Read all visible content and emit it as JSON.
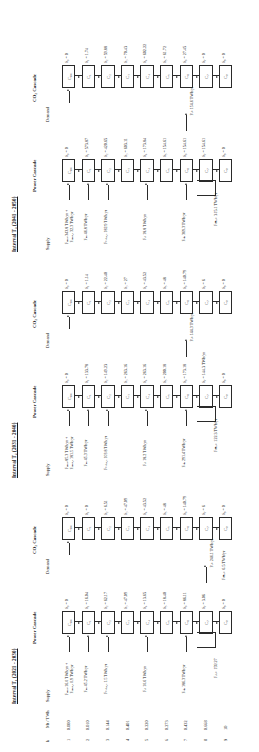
{
  "figure": {
    "title_hidden": "Power and CO2 cascade tables for three planning intervals",
    "row_header_k": "k",
    "row_header_mt": "Mt / TWh",
    "col_supply": "Supply",
    "col_demand": "Demand",
    "col_power_cascade": "Power Cascade",
    "col_co2_cascade": "CO₂ Cascade"
  },
  "axis": {
    "k_values": [
      "1",
      "2",
      "3",
      "4",
      "5",
      "6",
      "7",
      "8",
      "9"
    ],
    "mt_values": [
      "0.000",
      "0.010",
      "0.144",
      "0.401",
      "0.220",
      "0.273",
      "0.432",
      "0.668",
      "10"
    ]
  },
  "intervals": [
    {
      "id": "T1",
      "title": "Interval T₁ (2021 - 2030)",
      "power": {
        "cells": [
          "C₀₀₀",
          "C₁",
          "C₂",
          "C₃",
          "C₄",
          "C₅",
          "C₆",
          "C₇",
          "C₈"
        ],
        "deltas": [
          "δ₀ = 0",
          "δ₁ = 16.04",
          "δ₂ = 62.17",
          "δ₃ = 47.09",
          "δ₄ = 13.65",
          "δ₅ = 18.40",
          "δ₆ = 86.11",
          "δ₇ = 3.06",
          "δ₈ = 0"
        ],
        "supply_flows": [
          {
            "row": 1,
            "text": "Fₐₙₑᵥ 16.0 TWh/yr +\nFₐₙₑᵥ,ₑ 0.9 TWh/yr"
          },
          {
            "row": 2,
            "text": "Fₙₑ 45.2 TWh/yr"
          },
          {
            "row": 3,
            "text": "Fₛₒₗₐᵣ,ₑ 1.5 TWh/yr"
          },
          {
            "row": 5,
            "text": "Fₑₗ 10.6 TWh/yr"
          },
          {
            "row": 7,
            "text": "Fₒₕ 186.3 TWh/yr"
          }
        ],
        "demand_flows": [
          {
            "row": 8,
            "text": "Pₑₖ 246.1 TWh/yr"
          }
        ],
        "residual": "Fₑₗₑₛ 159.27"
      },
      "co2": {
        "cells": [
          "C₀₀₀",
          "C₁",
          "C₂",
          "C₃",
          "C₄",
          "C₅",
          "C₆",
          "C₇",
          "C₈"
        ],
        "deltas": [
          "δ₀ = 0",
          "δ₁ = 0",
          "δ₂ = 6.51",
          "δ₃ = 47.09",
          "δ₄ = 43.52",
          "δ₅ = 48",
          "δ₆ = 140.79",
          "δ₇ = 6",
          "δ₈ = 0"
        ],
        "residual": "Fₗₘₑₛ 6.5 TWh/yr"
      }
    },
    {
      "id": "T2",
      "title": "Interval T₂ (2031 - 2040)",
      "power": {
        "cells": [
          "C₀₀₀",
          "C₁",
          "C₂",
          "C₃",
          "C₄",
          "C₅",
          "C₆",
          "C₇",
          "C₈"
        ],
        "deltas": [
          "δ₀ = 0",
          "δ₁ = 133.78",
          "δ₂ = 149.23",
          "δ₃ = 263.16",
          "δ₄ = 263.16",
          "δ₅ = 200.18",
          "δ₆ = 173.18",
          "δ₇ = 144.3 TWh/yr",
          "δ₈ = 0"
        ],
        "supply_flows": [
          {
            "row": 1,
            "text": "Fₐₙₑᵥ 85.3 TWh/yr +\nFₐₙₑᵥ,ₑ 181.5 TWh/yr"
          },
          {
            "row": 2,
            "text": "Fₙₑ 45.3 TWh/yr"
          },
          {
            "row": 3,
            "text": "Fₛₒₗₐᵣ,ₑ 103.8 TWh/yr"
          },
          {
            "row": 5,
            "text": "Fₑₗ 18.2 TWh/yr"
          },
          {
            "row": 7,
            "text": "Fₒₕ 291.4 TWh/yr"
          }
        ],
        "demand_flows": [
          {
            "row": 7,
            "text": "Pₑₖ 144.3 TWh/yr"
          }
        ],
        "residual": "Fₗₘₑₛ 122.3 TWh/yr"
      },
      "co2": {
        "cells": [
          "C₀₀₀",
          "C₁",
          "C₂",
          "C₃",
          "C₄",
          "C₅",
          "C₆",
          "C₇",
          "C₈"
        ],
        "deltas": [
          "δ₀ = 0",
          "δ₁ = 1.14",
          "δ₂ = 22.40",
          "δ₃ = 27",
          "δ₄ = 43.52",
          "δ₅ = 48",
          "δ₆ = 140.79",
          "δ₇ = 6",
          "δ₈ = 0"
        ],
        "residual": ""
      }
    },
    {
      "id": "T3",
      "title": "Interval T₃ (2041 - 2050)",
      "power": {
        "cells": [
          "C₀₀₀",
          "C₁",
          "C₂",
          "C₃",
          "C₄",
          "C₅",
          "C₆",
          "C₇",
          "C₈"
        ],
        "deltas": [
          "δ₀ = 0",
          "δ₁ = 573.87",
          "δ₂ = 420.65",
          "δ₃ = 603.11",
          "δ₄ = 173.84",
          "δ₅ = 154.61",
          "δ₆ = 154.61",
          "δ₇ = 154.61",
          "δ₈ = 0"
        ],
        "supply_flows": [
          {
            "row": 1,
            "text": "Fₐₙₑᵥ 343.8 TWh/yr +\nFₐₙₑᵥ,ₑ 32.3 TWh/yr"
          },
          {
            "row": 2,
            "text": "Fₙₑ 46.8 TWh/yr"
          },
          {
            "row": 3,
            "text": "Fₛₒₗₐᵣ,ₑ 182.9 TWh/yr"
          },
          {
            "row": 5,
            "text": "Fₑₗ 18.8 TWh/yr"
          },
          {
            "row": 7,
            "text": "Fₒₕ 369.3 TWh/yr"
          }
        ],
        "demand_flows": [
          {
            "row": 7,
            "text": "Pₑₖ 154.6 TWh/yr"
          }
        ],
        "residual": "Fₗₘₑₛ 315.1 TWh/yr"
      },
      "co2": {
        "cells": [
          "C₀₀₀",
          "C₁",
          "C₂",
          "C₃",
          "C₄",
          "C₅",
          "C₆",
          "C₇",
          "C₈"
        ],
        "deltas": [
          "δ₀ = 0",
          "δ₁ = 1.74",
          "δ₂ = 59.88",
          "δ₃ = 70.43",
          "δ₄ = 602.22",
          "δ₅ = 61.72",
          "δ₆ = 27.45",
          "δ₇ = 0",
          "δ₈ = 0"
        ],
        "residual": ""
      }
    }
  ],
  "colors": {
    "ink": "#2a2a2a",
    "paper": "#ffffff"
  }
}
